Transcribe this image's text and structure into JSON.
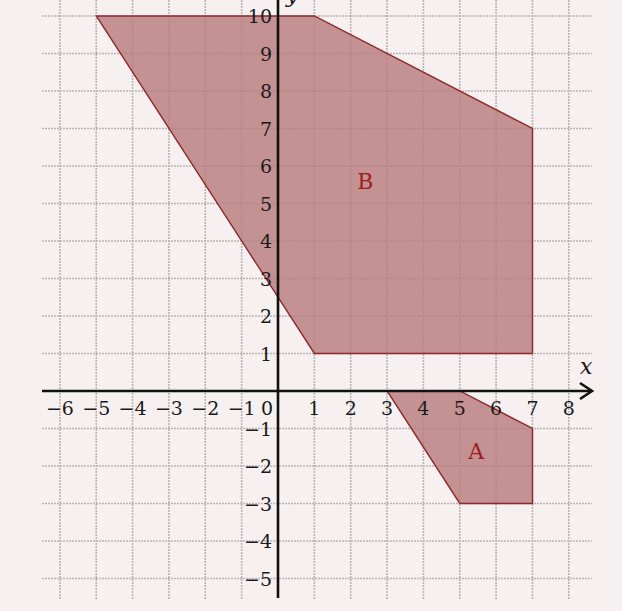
{
  "chart_data": {
    "type": "diagram",
    "title": "",
    "xlabel": "x",
    "ylabel": "y",
    "xlim": [
      -6.5,
      8.6
    ],
    "ylim": [
      -5.5,
      10.4
    ],
    "grid": true,
    "x_ticks": [
      -6,
      -5,
      -4,
      -3,
      -2,
      -1,
      0,
      1,
      2,
      3,
      4,
      5,
      6,
      7,
      8
    ],
    "y_ticks": [
      -5,
      -4,
      -3,
      -2,
      -1,
      1,
      2,
      3,
      4,
      5,
      6,
      7,
      8,
      9,
      10
    ],
    "x_tick_labels": [
      "−6",
      "−5",
      "−4",
      "−3",
      "−2",
      "−1",
      "0",
      "1",
      "2",
      "3",
      "4",
      "5",
      "6",
      "7",
      "8"
    ],
    "y_tick_labels": [
      "−5",
      "−4",
      "−3",
      "−2",
      "−1",
      "1",
      "2",
      "3",
      "4",
      "5",
      "6",
      "7",
      "8",
      "9",
      "10"
    ],
    "regions": [
      {
        "name": "B",
        "label": "B",
        "vertices": [
          [
            -5,
            10
          ],
          [
            1,
            10
          ],
          [
            7,
            7
          ],
          [
            7,
            1
          ],
          [
            1,
            1
          ]
        ],
        "label_pos": [
          2.4,
          5.4
        ]
      },
      {
        "name": "A",
        "label": "A",
        "vertices": [
          [
            3,
            0
          ],
          [
            5,
            0
          ],
          [
            7,
            -1
          ],
          [
            7,
            -3
          ],
          [
            5,
            -3
          ]
        ],
        "label_pos": [
          5.45,
          -1.8
        ]
      }
    ]
  },
  "colors": {
    "background": "#f7f0f0",
    "grid": "#b9b5b5",
    "axis": "#111111",
    "region_fill": "#b87c7e",
    "region_stroke": "#8e2a2c",
    "region_label": "#a01e22"
  },
  "labels": {
    "x_axis": "x",
    "y_axis": "y",
    "region_b": "B",
    "region_a": "A"
  }
}
